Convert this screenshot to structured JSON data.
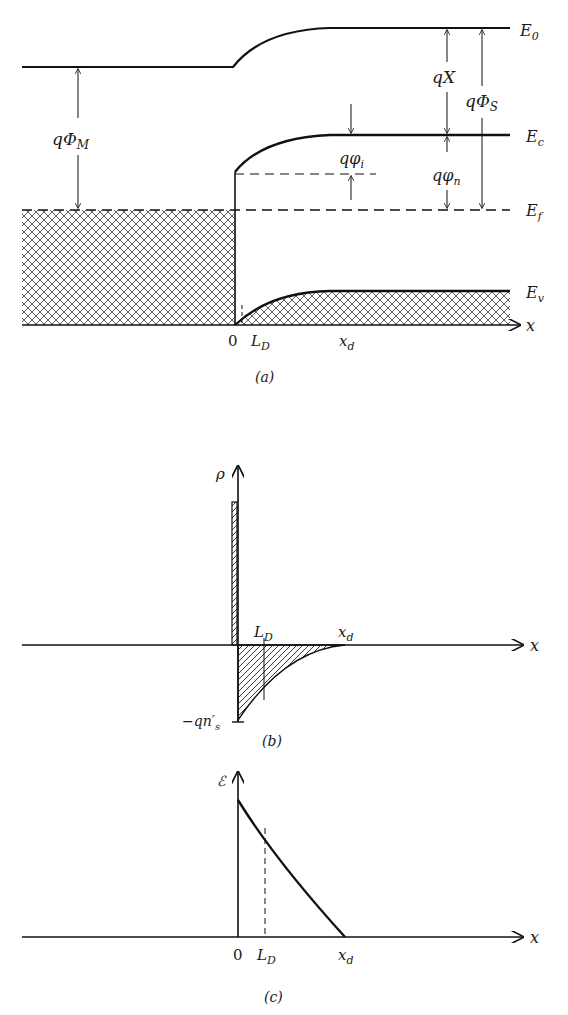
{
  "panel_a": {
    "caption": "(a)",
    "levels": {
      "E0": "E",
      "E0_sub": "0",
      "Ec": "E",
      "Ec_sub": "c",
      "Ef": "E",
      "Ef_sub": "f",
      "Ev": "E",
      "Ev_sub": "v"
    },
    "dims": {
      "qPhiM": "qΦ",
      "qPhiM_sub": "M",
      "qChi": "qX",
      "qPhiS": "qΦ",
      "qPhiS_sub": "S",
      "qphii": "qφ",
      "qphii_sub": "i",
      "qphin": "qφ",
      "qphin_sub": "n"
    },
    "axis": {
      "x": "x",
      "zero": "0",
      "LD": "L",
      "LD_sub": "D",
      "xd": "x",
      "xd_sub": "d"
    }
  },
  "panel_b": {
    "caption": "(b)",
    "y_label": "ρ",
    "x_label": "x",
    "LD": "L",
    "LD_sub": "D",
    "xd": "x",
    "xd_sub": "d",
    "neg_label": "−qn′",
    "neg_label_sub": "s"
  },
  "panel_c": {
    "caption": "(c)",
    "y_label": "ℰ",
    "x_label": "x",
    "zero": "0",
    "LD": "L",
    "LD_sub": "D",
    "xd": "x",
    "xd_sub": "d"
  }
}
